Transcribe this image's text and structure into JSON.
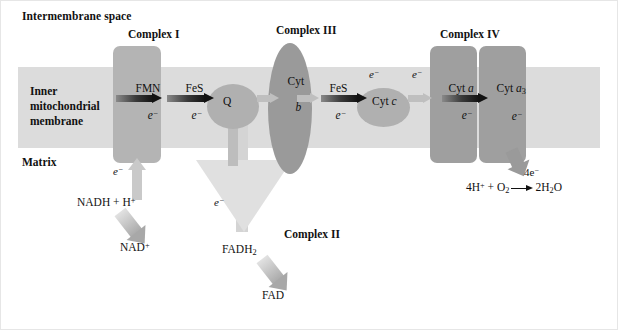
{
  "diagram": {
    "regions": {
      "intermembrane_space": "Intermembrane space",
      "matrix": "Matrix",
      "membrane_label_line1": "Inner",
      "membrane_label_line2": "mitochondrial",
      "membrane_label_line3": "membrane"
    },
    "complexes": [
      {
        "id": "complex-1",
        "label": "Complex I",
        "carriers": [
          "FMN",
          "FeS"
        ]
      },
      {
        "id": "complex-2",
        "label": "Complex II",
        "carriers": []
      },
      {
        "id": "complex-3",
        "label": "Complex III",
        "carriers": [
          "Cyt b",
          "FeS"
        ]
      },
      {
        "id": "complex-4",
        "label": "Complex IV",
        "carriers": [
          "Cyt a",
          "Cyt a3"
        ]
      }
    ],
    "carriers": {
      "fmn": "FMN",
      "fes_1": "FeS",
      "fes_2": "FeS",
      "q": "Q",
      "cyt_b_line1": "Cyt",
      "cyt_b_line2": "b",
      "cyt_c_prefix": "Cyt ",
      "cyt_c_italic": "c",
      "cyt_a_prefix": "Cyt ",
      "cyt_a_italic": "a",
      "cyt_a3_prefix": "Cyt ",
      "cyt_a3_italic": "a",
      "cyt_a3_sub": "3"
    },
    "electron_label": "e",
    "electron_charge": "−",
    "substrates": {
      "nadh": "NADH + H",
      "nadh_sup": "+",
      "nad": "NAD",
      "nad_sup": "+",
      "fadh2_base": "FADH",
      "fadh2_sub": "2",
      "fad": "FAD"
    },
    "terminal_reaction": {
      "electrons": "4e",
      "electrons_sup": "−",
      "left_h": "4H",
      "left_h_sup": "+",
      "plus": " + O",
      "o2_sub": "2",
      "product_coef": "2H",
      "product_sub": "2",
      "product_tail": "O"
    },
    "colors": {
      "background": "#ffffff",
      "membrane_band": "#dcdcdc",
      "complex_1": "#b4b4b4",
      "complex_3": "#9a9a9a",
      "complex_4": "#9f9f9f",
      "complex_2": "#e0e0e0",
      "carrier_circle": "#b0b0b0",
      "arrow_dark": "#141414",
      "arrow_light": "#bfbfbf",
      "text": "#111111"
    }
  }
}
